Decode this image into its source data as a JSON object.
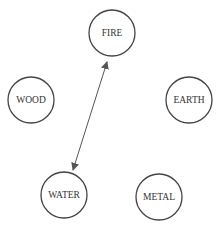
{
  "diagram": {
    "type": "network",
    "nodes": [
      {
        "id": "fire",
        "label": "FIRE",
        "cx": 112,
        "cy": 33,
        "r": 23
      },
      {
        "id": "wood",
        "label": "WOOD",
        "cx": 31,
        "cy": 100,
        "r": 23
      },
      {
        "id": "earth",
        "label": "EARTH",
        "cx": 189,
        "cy": 100,
        "r": 23
      },
      {
        "id": "water",
        "label": "WATER",
        "cx": 64,
        "cy": 195,
        "r": 23
      },
      {
        "id": "metal",
        "label": "METAL",
        "cx": 159,
        "cy": 197,
        "r": 23
      }
    ],
    "edges": [
      {
        "from": "fire",
        "to": "water",
        "direction": "bidirectional"
      }
    ],
    "colors": {
      "stroke": "#444444",
      "text": "#333333",
      "edge": "#555555",
      "background": "#ffffff"
    }
  }
}
